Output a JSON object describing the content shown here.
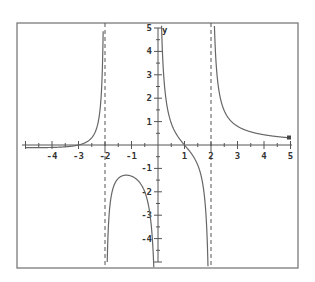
{
  "chart_data": {
    "type": "line",
    "title": "",
    "xlabel": "x",
    "ylabel": "y",
    "xlim": [
      -5,
      5
    ],
    "ylim": [
      -5,
      5
    ],
    "grid": false,
    "x_tick_labels": [
      "-4",
      "-3",
      "-2",
      "-1",
      "1",
      "2",
      "3",
      "4",
      "5"
    ],
    "y_tick_labels": [
      "5",
      "4",
      "3",
      "2",
      "1",
      "-1",
      "-2",
      "-3",
      "-4"
    ],
    "vertical_asymptotes": [
      -2,
      0,
      2
    ],
    "zeros": [
      -3,
      1
    ],
    "series": [
      {
        "name": "f(x)",
        "segments": [
          {
            "x": [
              -5,
              -4.5,
              -4,
              -3.5,
              -3,
              -2.75,
              -2.5,
              -2.3,
              -2.2,
              -2.15
            ],
            "y": [
              -0.11,
              -0.12,
              -0.1,
              -0.07,
              0,
              0.1,
              0.4,
              1.2,
              2.4,
              3.6
            ]
          },
          {
            "x": [
              -1.93,
              -1.85,
              -1.7,
              -1.5,
              -1.2,
              -1,
              -0.8,
              -0.6,
              -0.4,
              -0.3,
              -0.25
            ],
            "y": [
              -5,
              -3.3,
              -2.1,
              -1.5,
              -1.31,
              -1.33,
              -1.5,
              -1.98,
              -3.0,
              -4.0,
              -4.8
            ]
          },
          {
            "x": [
              0.17,
              0.2,
              0.3,
              0.5,
              0.7,
              1,
              1.3,
              1.6,
              1.8,
              1.9,
              1.95
            ],
            "y": [
              4.9,
              4.0,
              2.7,
              1.4,
              0.72,
              0,
              -0.7,
              -1.7,
              -3.3,
              -5
            ]
          },
          {
            "x": [
              2.07,
              2.1,
              2.2,
              2.4,
              2.7,
              3,
              3.5,
              4,
              4.5,
              5
            ],
            "y": [
              5,
              4.6,
              2.45,
              1.38,
              0.89,
              0.72,
              0.54,
              0.44,
              0.36,
              0.3
            ]
          }
        ]
      }
    ]
  },
  "axes": {
    "x_label": "x",
    "y_label": "y"
  }
}
